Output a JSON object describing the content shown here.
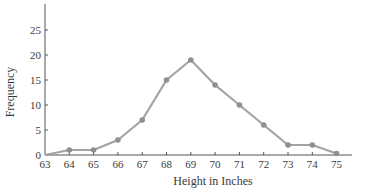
{
  "chart_data": {
    "type": "line",
    "title": "",
    "xlabel": "Height in Inches",
    "ylabel": "Frequency",
    "x": [
      63,
      64,
      65,
      66,
      67,
      68,
      69,
      70,
      71,
      72,
      73,
      74,
      75
    ],
    "values": [
      0,
      1,
      1,
      3,
      7,
      15,
      19,
      14,
      10,
      6,
      2,
      2,
      0
    ],
    "x_ticks": [
      "63",
      "64",
      "65",
      "66",
      "67",
      "68",
      "69",
      "70",
      "71",
      "72",
      "73",
      "74",
      "75"
    ],
    "y_ticks": [
      "0",
      "5",
      "10",
      "15",
      "20",
      "25"
    ],
    "ylim": [
      0,
      30
    ],
    "xlim": [
      63,
      75
    ],
    "grid": false,
    "legend": null,
    "colors": {
      "line": "#a3a3a3",
      "marker": "#8f8f8f",
      "axis": "#555555",
      "text": "#3a3a3a"
    }
  }
}
